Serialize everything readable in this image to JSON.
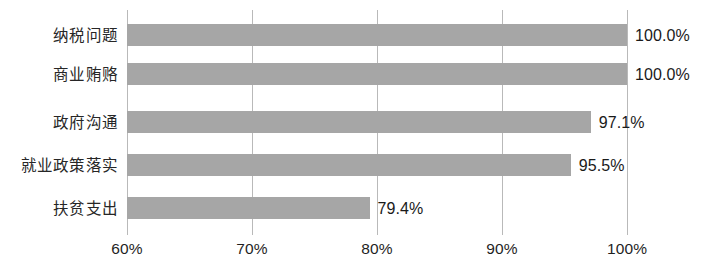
{
  "chart_data": {
    "type": "bar",
    "orientation": "horizontal",
    "title": "",
    "subtitle": "",
    "xlabel": "",
    "ylabel": "",
    "categories": [
      "纳税问题",
      "商业贿赂",
      "政府沟通",
      "就业政策落实",
      "扶贫支出"
    ],
    "values": [
      100.0,
      100.0,
      97.1,
      95.5,
      79.4
    ],
    "value_labels": [
      "100.0%",
      "100.0%",
      "97.1%",
      "95.5%",
      "79.4%"
    ],
    "xlim": [
      60,
      100
    ],
    "xticks": [
      60,
      70,
      80,
      90,
      100
    ],
    "xtick_labels": [
      "60%",
      "70%",
      "80%",
      "90%",
      "100%"
    ],
    "grid": true,
    "grid_axis": "x",
    "legend": false,
    "legend_position": "none",
    "series": [
      {
        "name": "",
        "values": [
          100.0,
          100.0,
          97.1,
          95.5,
          79.4
        ]
      }
    ]
  },
  "style": {
    "bar_color": "#a6a6a6",
    "grid_color": "#b9b9b9",
    "text_color": "#1a1a1a",
    "background_color": "#ffffff"
  }
}
